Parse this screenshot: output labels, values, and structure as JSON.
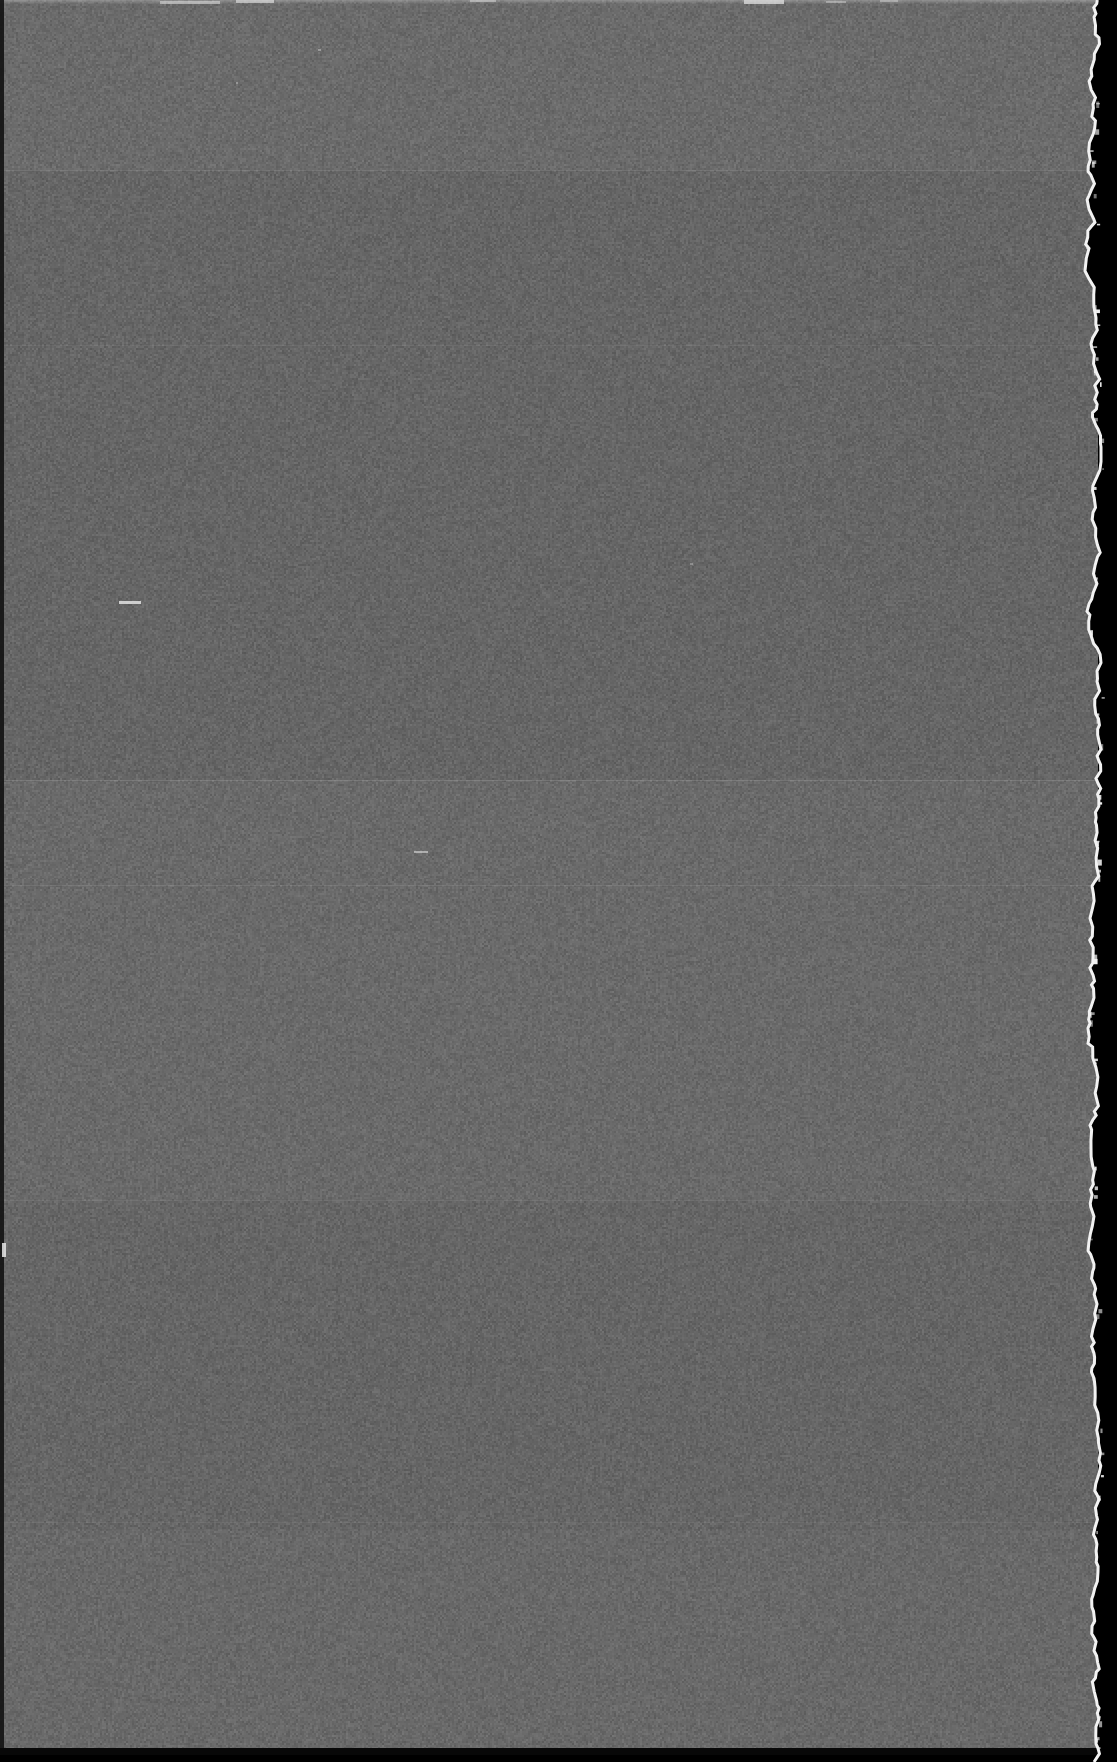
{
  "frame": {
    "title": "Scanned blank film frame",
    "description": "Uniform fogged gray emulsion field on a black scanner background with a ragged torn right edge",
    "width_px": 1117,
    "height_px": 1762,
    "medium": "film-scan",
    "content_text": "",
    "has_legible_text": "false"
  },
  "colors": {
    "emulsion_gray": "#686868",
    "emulsion_gray_light": "#6f6f6f",
    "emulsion_gray_dark": "#626262",
    "surround_black": "#000000",
    "edge_strip_dark": "#141414",
    "torn_edge_white": "#f2f2f2",
    "speck_white": "#e8e8e8"
  },
  "geometry": {
    "emulsion_left_px": 0,
    "emulsion_top_px": 0,
    "emulsion_width_px": 1098,
    "emulsion_height_px": 1755,
    "left_edge_strip_width_px": 4,
    "bottom_edge_strip_height_px": 7,
    "right_black_margin_px": 19,
    "torn_edge_mean_x_px": 1094
  },
  "tone_bands": [
    {
      "name": "band-top",
      "top_px": 0,
      "height_px": 170,
      "tint": "rgba(255,255,255,0.022)"
    },
    {
      "name": "band-upper-mid",
      "top_px": 170,
      "height_px": 610,
      "tint": "rgba(0,0,0,0.012)"
    },
    {
      "name": "band-mid",
      "top_px": 780,
      "height_px": 420,
      "tint": "rgba(255,255,255,0.014)"
    },
    {
      "name": "band-lower-mid",
      "top_px": 1200,
      "height_px": 330,
      "tint": "rgba(0,0,0,0.016)"
    },
    {
      "name": "band-bottom",
      "top_px": 1530,
      "height_px": 225,
      "tint": "rgba(255,255,255,0.010)"
    }
  ],
  "seam_lines": [
    {
      "name": "seam-170",
      "top_px": 170,
      "tint": "rgba(255,255,255,0.10)"
    },
    {
      "name": "seam-345",
      "top_px": 345,
      "tint": "rgba(255,255,255,0.05)"
    },
    {
      "name": "seam-780",
      "top_px": 780,
      "tint": "rgba(255,255,255,0.12)"
    },
    {
      "name": "seam-885",
      "top_px": 885,
      "tint": "rgba(255,255,255,0.09)"
    },
    {
      "name": "seam-1200",
      "top_px": 1200,
      "tint": "rgba(255,255,255,0.08)"
    },
    {
      "name": "seam-1522",
      "top_px": 1522,
      "tint": "rgba(255,255,255,0.05)"
    }
  ],
  "specks": [
    {
      "name": "speck-scratch-dash",
      "left_px": 119,
      "top_px": 601,
      "width_px": 22,
      "height_px": 3,
      "opacity": 0.8
    },
    {
      "name": "speck-small-dash",
      "left_px": 414,
      "top_px": 851,
      "width_px": 14,
      "height_px": 2,
      "opacity": 0.55
    },
    {
      "name": "speck-left-streak",
      "left_px": 2,
      "top_px": 1243,
      "width_px": 4,
      "height_px": 14,
      "opacity": 0.85
    },
    {
      "name": "speck-top-streak-a",
      "left_px": 160,
      "top_px": 1,
      "width_px": 60,
      "height_px": 3,
      "opacity": 0.55
    },
    {
      "name": "speck-top-streak-b",
      "left_px": 236,
      "top_px": 0,
      "width_px": 38,
      "height_px": 3,
      "opacity": 0.6
    },
    {
      "name": "speck-top-streak-c",
      "left_px": 470,
      "top_px": 0,
      "width_px": 26,
      "height_px": 2,
      "opacity": 0.45
    },
    {
      "name": "speck-top-streak-d",
      "left_px": 744,
      "top_px": 0,
      "width_px": 40,
      "height_px": 4,
      "opacity": 0.7
    },
    {
      "name": "speck-top-streak-e",
      "left_px": 826,
      "top_px": 1,
      "width_px": 20,
      "height_px": 2,
      "opacity": 0.4
    },
    {
      "name": "speck-top-streak-f",
      "left_px": 880,
      "top_px": 0,
      "width_px": 18,
      "height_px": 2,
      "opacity": 0.38
    },
    {
      "name": "speck-field-a",
      "left_px": 318,
      "top_px": 49,
      "width_px": 3,
      "height_px": 2,
      "opacity": 0.4
    },
    {
      "name": "speck-field-b",
      "left_px": 236,
      "top_px": 82,
      "width_px": 2,
      "height_px": 2,
      "opacity": 0.35
    },
    {
      "name": "speck-field-c",
      "left_px": 690,
      "top_px": 563,
      "width_px": 3,
      "height_px": 2,
      "opacity": 0.3
    }
  ],
  "torn_edge": {
    "name": "ragged-right-edge",
    "fringe_color": "#f2f2f2",
    "fringe_width_px": 3,
    "notes": "Irregular hand-torn emulsion boundary with bright halation fringe; flecks protrude into the black surround in the upper half."
  },
  "grain": {
    "name": "film-grain",
    "base_level": 104,
    "amplitude": 17,
    "seed": 20240517,
    "tile_px": 512
  }
}
